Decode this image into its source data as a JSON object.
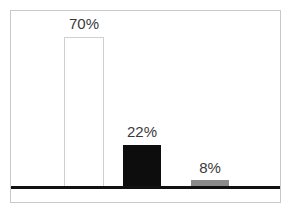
{
  "chart_data": {
    "type": "bar",
    "title": "",
    "subtitle": "",
    "xlabel": "",
    "ylabel": "",
    "categories": [
      "",
      "",
      ""
    ],
    "values": [
      70,
      22,
      8
    ],
    "data_labels": [
      "70%",
      "22%",
      "8%"
    ],
    "series": [
      {
        "name": "",
        "values": [
          70,
          22,
          8
        ],
        "labels": [
          "70%",
          "22%",
          "8%"
        ]
      }
    ],
    "ylim": [
      0,
      100
    ],
    "grid": false,
    "legend": false,
    "legend_position": "none",
    "tick_labels": [],
    "annotations": [],
    "bar_colors": [
      "#ffffff",
      "#0d0d0d",
      "#8a8a8a"
    ],
    "bar_outline_colors": [
      "#cfcfcf",
      "#0d0d0d",
      "#8a8a8a"
    ],
    "axis_color": "#111111",
    "frame_color": "#c9c9c9",
    "label_color": "#3a3a3a",
    "background": "#ffffff"
  },
  "bars": [
    {
      "name": "bar-1",
      "label": "70%",
      "value": 70,
      "left": 64,
      "width": 40,
      "top": 37,
      "height": 150,
      "label_left": 57,
      "label_top": 16,
      "label_width": 54
    },
    {
      "name": "bar-2",
      "label": "22%",
      "value": 22,
      "left": 123,
      "width": 38,
      "top": 145,
      "height": 42,
      "label_left": 115,
      "label_top": 124,
      "label_width": 54
    },
    {
      "name": "bar-3",
      "label": "8%",
      "value": 8,
      "left": 191,
      "width": 38,
      "top": 180,
      "height": 7,
      "label_left": 183,
      "label_top": 160,
      "label_width": 54
    }
  ]
}
